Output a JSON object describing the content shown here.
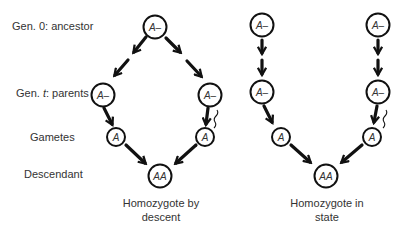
{
  "row_labels": {
    "gen0": "Gen. 0: ancestor",
    "gent_prefix": "Gen. ",
    "gent_var": "t",
    "gent_suffix": ": parents",
    "gametes": "Gametes",
    "descendant": "Descendant"
  },
  "left_diagram": {
    "caption_line1": "Homozygote by",
    "caption_line2": "descent",
    "nodes": {
      "ancestor": "A–",
      "parent_left": "A–",
      "parent_right": "A–",
      "gamete_left": "A",
      "gamete_right": "A",
      "descendant": "AA"
    }
  },
  "right_diagram": {
    "caption_line1": "Homozygote in",
    "caption_line2": "state",
    "nodes": {
      "ancestor_left": "A–",
      "ancestor_right": "A–",
      "parent_left": "A–",
      "parent_right": "A–",
      "gamete_left": "A",
      "gamete_right": "A",
      "descendant": "AA"
    }
  }
}
